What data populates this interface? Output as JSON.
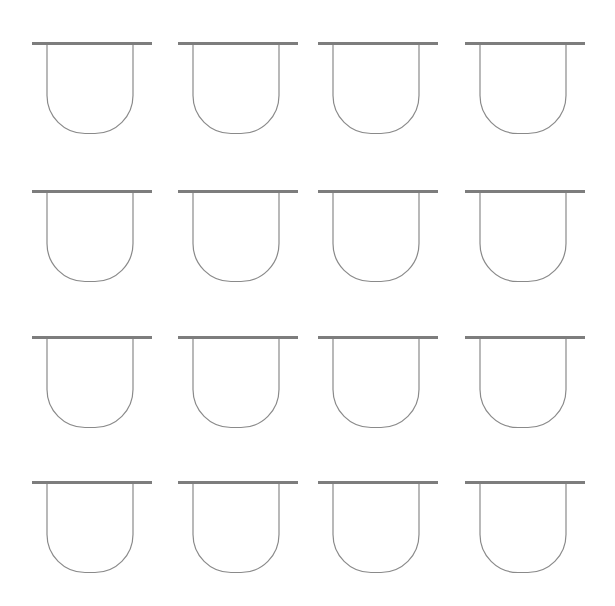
{
  "canvas": {
    "width": 615,
    "height": 606,
    "background_color": "#ffffff"
  },
  "figure": {
    "glyph_name": "bar-over-u-vessel",
    "rows": 4,
    "columns": 4,
    "total_glyphs": 16
  },
  "style": {
    "bar_color": "#7d7d7d",
    "bar_thickness_px": 3,
    "stroke_color": "#8a8a8a",
    "stroke_width_px": 1.2,
    "fill": "none"
  },
  "geometry": {
    "bar_width_px": 120,
    "u_left_offset_px": 15,
    "u_right_offset_px": 101,
    "u_depth_px": 90,
    "u_corner_radius_px": 38,
    "column_x": [
      32,
      178,
      318,
      465
    ],
    "row_y": [
      42,
      190,
      336,
      481
    ]
  },
  "glyphs": [
    {
      "id": "glyph-r1-c1",
      "row": 1,
      "col": 1,
      "x": 32,
      "y": 42,
      "label": "glyph row 1 column 1"
    },
    {
      "id": "glyph-r1-c2",
      "row": 1,
      "col": 2,
      "x": 178,
      "y": 42,
      "label": "glyph row 1 column 2"
    },
    {
      "id": "glyph-r1-c3",
      "row": 1,
      "col": 3,
      "x": 318,
      "y": 42,
      "label": "glyph row 1 column 3"
    },
    {
      "id": "glyph-r1-c4",
      "row": 1,
      "col": 4,
      "x": 465,
      "y": 42,
      "label": "glyph row 1 column 4"
    },
    {
      "id": "glyph-r2-c1",
      "row": 2,
      "col": 1,
      "x": 32,
      "y": 190,
      "label": "glyph row 2 column 1"
    },
    {
      "id": "glyph-r2-c2",
      "row": 2,
      "col": 2,
      "x": 178,
      "y": 190,
      "label": "glyph row 2 column 2"
    },
    {
      "id": "glyph-r2-c3",
      "row": 2,
      "col": 3,
      "x": 318,
      "y": 190,
      "label": "glyph row 2 column 3"
    },
    {
      "id": "glyph-r2-c4",
      "row": 2,
      "col": 4,
      "x": 465,
      "y": 190,
      "label": "glyph row 2 column 4"
    },
    {
      "id": "glyph-r3-c1",
      "row": 3,
      "col": 1,
      "x": 32,
      "y": 336,
      "label": "glyph row 3 column 1"
    },
    {
      "id": "glyph-r3-c2",
      "row": 3,
      "col": 2,
      "x": 178,
      "y": 336,
      "label": "glyph row 3 column 2"
    },
    {
      "id": "glyph-r3-c3",
      "row": 3,
      "col": 3,
      "x": 318,
      "y": 336,
      "label": "glyph row 3 column 3"
    },
    {
      "id": "glyph-r3-c4",
      "row": 3,
      "col": 4,
      "x": 465,
      "y": 336,
      "label": "glyph row 3 column 4"
    },
    {
      "id": "glyph-r4-c1",
      "row": 4,
      "col": 1,
      "x": 32,
      "y": 481,
      "label": "glyph row 4 column 1"
    },
    {
      "id": "glyph-r4-c2",
      "row": 4,
      "col": 2,
      "x": 178,
      "y": 481,
      "label": "glyph row 4 column 2"
    },
    {
      "id": "glyph-r4-c3",
      "row": 4,
      "col": 3,
      "x": 318,
      "y": 481,
      "label": "glyph row 4 column 3"
    },
    {
      "id": "glyph-r4-c4",
      "row": 4,
      "col": 4,
      "x": 465,
      "y": 481,
      "label": "glyph row 4 column 4"
    }
  ]
}
